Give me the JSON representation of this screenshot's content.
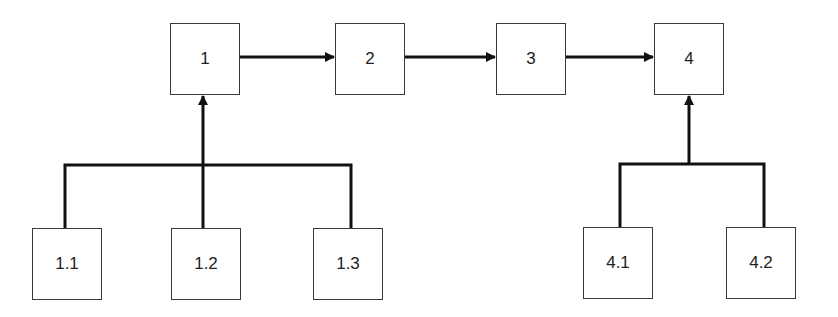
{
  "diagram": {
    "type": "hierarchical-flow",
    "line_color": "#111111",
    "box_border_color": "#3a3a3a",
    "top_row": [
      {
        "id": "1",
        "label": "1",
        "x": 170,
        "y": 23
      },
      {
        "id": "2",
        "label": "2",
        "x": 335,
        "y": 23
      },
      {
        "id": "3",
        "label": "3",
        "x": 496,
        "y": 23
      },
      {
        "id": "4",
        "label": "4",
        "x": 654,
        "y": 23
      }
    ],
    "bottom_row": [
      {
        "id": "1.1",
        "label": "1.1",
        "parent": "1",
        "x": 32,
        "y": 228
      },
      {
        "id": "1.2",
        "label": "1.2",
        "parent": "1",
        "x": 171,
        "y": 228
      },
      {
        "id": "1.3",
        "label": "1.3",
        "parent": "1",
        "x": 313,
        "y": 228
      },
      {
        "id": "4.1",
        "label": "4.1",
        "parent": "4",
        "x": 583,
        "y": 227
      },
      {
        "id": "4.2",
        "label": "4.2",
        "parent": "4",
        "x": 726,
        "y": 227
      }
    ],
    "edges": [
      {
        "from": "1",
        "to": "2"
      },
      {
        "from": "2",
        "to": "3"
      },
      {
        "from": "3",
        "to": "4"
      },
      {
        "from": [
          "1.1",
          "1.2",
          "1.3"
        ],
        "to": "1"
      },
      {
        "from": [
          "4.1",
          "4.2"
        ],
        "to": "4"
      }
    ]
  }
}
